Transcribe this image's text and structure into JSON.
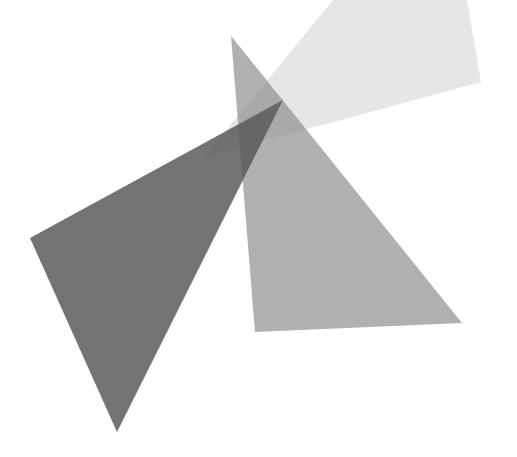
{
  "canvas": {
    "width": 517,
    "height": 457,
    "background": "#ffffff"
  },
  "shapes": [
    {
      "name": "light-quad",
      "points": "333,0 467,0 481,82 204,157",
      "fill": "#d6d6d6",
      "opacity": 0.6
    },
    {
      "name": "medium-triangle",
      "points": "231,36 462,323 255,332",
      "fill": "#8f8f8f",
      "opacity": 0.7
    },
    {
      "name": "dark-triangle",
      "points": "283,100 117,432 30,238",
      "fill": "#5a5a5a",
      "opacity": 0.85
    }
  ]
}
